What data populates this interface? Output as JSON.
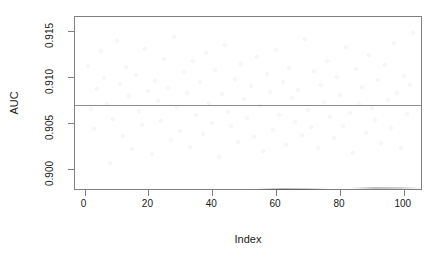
{
  "chart_data": {
    "type": "scatter",
    "title": "",
    "xlabel": "Index",
    "ylabel": "AUC",
    "xlim": [
      -3.0,
      106.0
    ],
    "ylim": [
      0.89755,
      0.91655
    ],
    "grid": false,
    "legend": "none",
    "point_symbol": "open-circle",
    "point_color": "#f2f2f2",
    "point_radius_px": 2,
    "xticks": [
      0,
      20,
      40,
      60,
      80,
      100
    ],
    "xtick_labels": [
      "0",
      "20",
      "40",
      "60",
      "80",
      "100"
    ],
    "yticks": [
      0.9,
      0.905,
      0.91,
      0.915
    ],
    "ytick_labels": [
      "0.900",
      "0.905",
      "0.910",
      "0.915"
    ],
    "annotations": [
      {
        "type": "hline",
        "y": 0.9069,
        "color": "#8c8c8c",
        "label": ""
      }
    ],
    "series": [
      {
        "name": "AUC",
        "x": [
          1,
          2,
          3,
          4,
          5,
          6,
          7,
          8,
          9,
          10,
          11,
          12,
          13,
          14,
          15,
          16,
          17,
          18,
          19,
          20,
          21,
          22,
          23,
          24,
          25,
          26,
          27,
          28,
          29,
          30,
          31,
          32,
          33,
          34,
          35,
          36,
          37,
          38,
          39,
          40,
          41,
          42,
          43,
          44,
          45,
          46,
          47,
          48,
          49,
          50,
          51,
          52,
          53,
          54,
          55,
          56,
          57,
          58,
          59,
          60,
          61,
          62,
          63,
          64,
          65,
          66,
          67,
          68,
          69,
          70,
          71,
          72,
          73,
          74,
          75,
          76,
          77,
          78,
          79,
          80,
          81,
          82,
          83,
          84,
          85,
          86,
          87,
          88,
          89,
          90,
          91,
          92,
          93,
          94,
          95,
          96,
          97,
          98,
          99,
          100,
          101,
          102,
          103
        ],
        "y": [
          0.9112,
          0.9065,
          0.9043,
          0.9087,
          0.9128,
          0.9099,
          0.9071,
          0.9006,
          0.9054,
          0.9139,
          0.9092,
          0.9036,
          0.9111,
          0.9079,
          0.9021,
          0.9102,
          0.9063,
          0.9048,
          0.9131,
          0.9085,
          0.9016,
          0.9096,
          0.9074,
          0.9052,
          0.912,
          0.9088,
          0.9031,
          0.9144,
          0.9067,
          0.9041,
          0.9105,
          0.9083,
          0.9024,
          0.9117,
          0.9059,
          0.9094,
          0.9038,
          0.9126,
          0.9072,
          0.905,
          0.9108,
          0.9013,
          0.9081,
          0.9135,
          0.9062,
          0.9046,
          0.9098,
          0.9029,
          0.9114,
          0.9076,
          0.9055,
          0.909,
          0.9034,
          0.9122,
          0.9068,
          0.9019,
          0.9103,
          0.9084,
          0.9042,
          0.913,
          0.9058,
          0.9095,
          0.9026,
          0.911,
          0.9077,
          0.9051,
          0.9086,
          0.9037,
          0.9141,
          0.9064,
          0.9045,
          0.9106,
          0.9022,
          0.9091,
          0.9073,
          0.9118,
          0.9056,
          0.9033,
          0.91,
          0.908,
          0.9047,
          0.9133,
          0.9061,
          0.9017,
          0.9109,
          0.907,
          0.9089,
          0.9039,
          0.9124,
          0.9066,
          0.9053,
          0.9097,
          0.9028,
          0.9113,
          0.9075,
          0.9044,
          0.9137,
          0.9082,
          0.9023,
          0.9101,
          0.906,
          0.9091,
          0.9148
        ]
      }
    ]
  }
}
